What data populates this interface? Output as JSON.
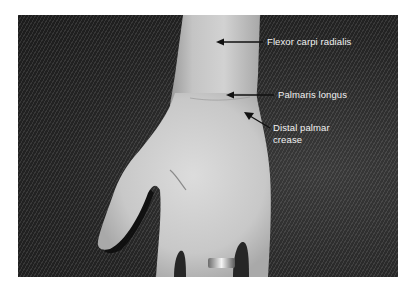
{
  "figure": {
    "labels": [
      {
        "id": "flexor-carpi-radialis",
        "text": "Flexor carpi radialis"
      },
      {
        "id": "palmaris-longus",
        "text": "Palmaris longus"
      },
      {
        "id": "distal-palmar-crease",
        "line1": "Distal palmar",
        "line2": "crease"
      }
    ],
    "colors": {
      "background": "#2a2a2a",
      "skin": "#c9c9c9",
      "label_text": "#f2f2f2",
      "arrow": "#111111",
      "page": "#ffffff"
    }
  }
}
